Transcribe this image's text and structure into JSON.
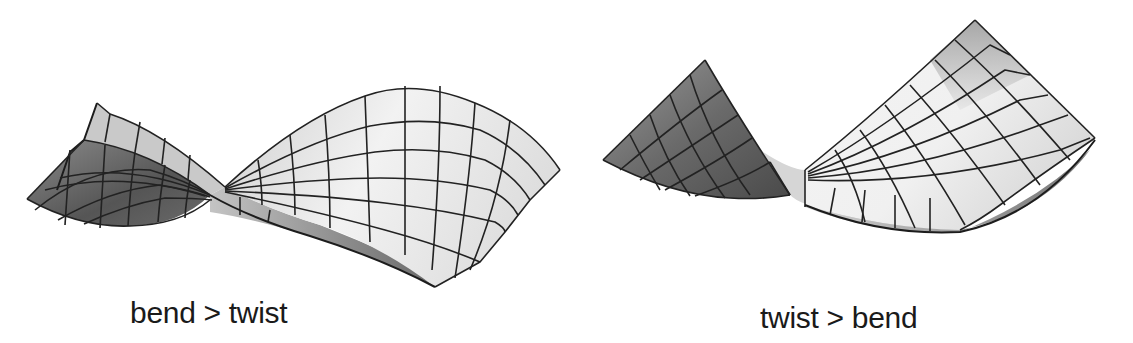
{
  "figure": {
    "panels": [
      {
        "id": "left",
        "caption": "bend > twist",
        "description": "3D shaded grid mesh of a strip that bends more than it twists"
      },
      {
        "id": "right",
        "caption": "twist > bend",
        "description": "3D shaded grid mesh of a strip that twists more than it bends"
      }
    ],
    "colors": {
      "light_face": "#e8e8e8",
      "mid_face": "#b5b5b5",
      "dark_face": "#6e6e6e",
      "grid_line": "#222222",
      "text": "#1a1a1a",
      "background": "#ffffff"
    }
  }
}
